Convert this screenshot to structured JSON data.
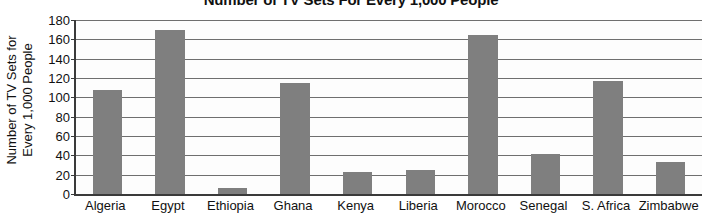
{
  "chart_data": {
    "type": "bar",
    "title": "Number of TV Sets For Every 1,000 People",
    "xlabel": "",
    "ylabel": "Number of TV Sets for Every 1,000 People",
    "ylabel_lines": [
      "Number of TV Sets for",
      "Every 1,000 People"
    ],
    "categories": [
      "Algeria",
      "Egypt",
      "Ethiopia",
      "Ghana",
      "Kenya",
      "Liberia",
      "Morocco",
      "Senegal",
      "S. Africa",
      "Zimbabwe"
    ],
    "values": [
      108,
      170,
      6,
      115,
      23,
      25,
      165,
      41,
      117,
      33
    ],
    "ylim": [
      0,
      180
    ],
    "ytick_values": [
      0,
      20,
      40,
      60,
      80,
      100,
      120,
      140,
      160,
      180
    ],
    "ytick_labels": [
      "0",
      "20",
      "40",
      "60",
      "80",
      "100",
      "120",
      "140",
      "160",
      "180"
    ],
    "grid": true,
    "legend": false,
    "bar_color": "#7f7f7f",
    "axis_color": "#3a3a3a",
    "gridline_color": "#6f6f6f",
    "background_color": "#ffffff"
  }
}
